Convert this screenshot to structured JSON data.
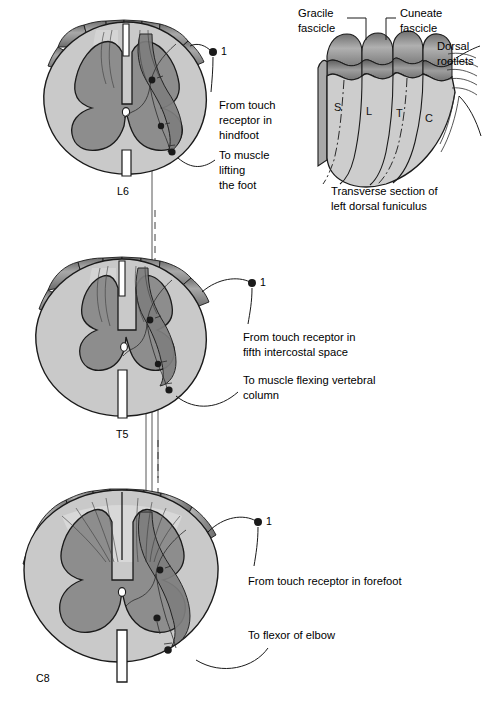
{
  "figure": {
    "background_color": "#ffffff",
    "ink_color": "#1a1a1a",
    "white_matter_color": "#c9c9c9",
    "gray_matter_color": "#8d8d8d",
    "rootlet_color": "#9a9a9a",
    "highlight_color": "#7e7e7e"
  },
  "sections": [
    {
      "id": "l6",
      "level_label": "L6",
      "marker_number": "1",
      "labels": [
        {
          "name": "from-touch-receptor",
          "lines": [
            "From touch",
            "receptor in",
            "hindfoot"
          ]
        },
        {
          "name": "to-muscle",
          "lines": [
            "To muscle",
            "lifting",
            "the foot"
          ]
        }
      ]
    },
    {
      "id": "t5",
      "level_label": "T5",
      "marker_number": "1",
      "labels": [
        {
          "name": "from-touch-receptor",
          "lines": [
            "From touch receptor in",
            "fifth intercostal space"
          ]
        },
        {
          "name": "to-muscle",
          "lines": [
            "To muscle flexing vertebral",
            "column"
          ]
        }
      ]
    },
    {
      "id": "c8",
      "level_label": "C8",
      "marker_number": "1",
      "labels": [
        {
          "name": "from-touch-receptor",
          "lines": [
            "From touch receptor in forefoot"
          ]
        },
        {
          "name": "to-muscle",
          "lines": [
            "To flexor of elbow"
          ]
        }
      ]
    }
  ],
  "funiculus": {
    "caption": [
      "Transverse section of",
      "left dorsal funiculus"
    ],
    "callouts": [
      {
        "name": "gracile-fascicle",
        "lines": [
          "Gracile",
          "fascicle"
        ]
      },
      {
        "name": "cuneate-fascicle",
        "lines": [
          "Cuneate",
          "fascicle"
        ]
      },
      {
        "name": "dorsal-rootlets",
        "lines": [
          "Dorsal",
          "rootlets"
        ]
      }
    ],
    "segment_letters": [
      "S",
      "L",
      "T",
      "C"
    ]
  }
}
